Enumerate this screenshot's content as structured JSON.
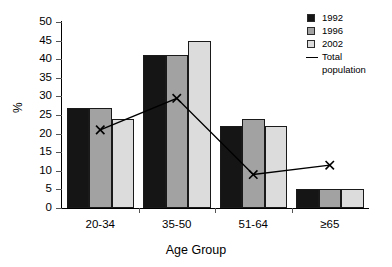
{
  "chart_data": {
    "type": "bar",
    "title": "",
    "xlabel": "Age Group",
    "ylabel": "%",
    "categories": [
      "20-34",
      "35-50",
      "51-64",
      "≥65"
    ],
    "ylim": [
      0,
      50
    ],
    "yticks": [
      0,
      5,
      10,
      15,
      20,
      25,
      30,
      35,
      40,
      45,
      50
    ],
    "grid": false,
    "legend_position": "top-right",
    "series": [
      {
        "name": "1992",
        "type": "bar",
        "color": "#151515",
        "values": [
          27,
          41,
          22,
          5
        ]
      },
      {
        "name": "1996",
        "type": "bar",
        "color": "#a2a2a2",
        "values": [
          27,
          41,
          24,
          5
        ]
      },
      {
        "name": "2002",
        "type": "bar",
        "color": "#dcdcdc",
        "values": [
          24,
          45,
          22,
          5
        ]
      },
      {
        "name": "Total population",
        "type": "line",
        "color": "#000000",
        "marker": "x",
        "values": [
          21,
          29.5,
          9,
          11.5
        ]
      }
    ]
  },
  "axis": {
    "y_title": "%",
    "x_title": "Age Group",
    "y_tick_labels": [
      "50",
      "45",
      "40",
      "35",
      "30",
      "25",
      "20",
      "15",
      "10",
      "5",
      "0"
    ],
    "x_tick_labels": [
      "20-34",
      "35-50",
      "51-64",
      "≥65"
    ]
  },
  "legend": {
    "items": [
      {
        "label": "1992",
        "kind": "swatch"
      },
      {
        "label": "1996",
        "kind": "swatch"
      },
      {
        "label": "2002",
        "kind": "swatch"
      },
      {
        "label": "Total",
        "label2": "population",
        "kind": "line"
      }
    ]
  }
}
